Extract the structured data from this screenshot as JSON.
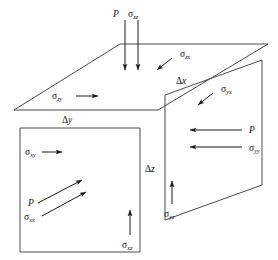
{
  "figure": {
    "background_color": "#ffffff",
    "line_color": "#4a4a4a",
    "arrow_color": "#1a1a1a",
    "text_color": "#111111"
  },
  "faces": {
    "top_face": {
      "name": "top-face",
      "normal_axis": "z",
      "points": "120,44 268,44 158,110 14,110"
    },
    "front_face": {
      "name": "front-face",
      "normal_axis": "x",
      "points": "20,128 140,128 140,252 20,252"
    },
    "right_face": {
      "name": "right-face",
      "normal_axis": "y",
      "points": "165,95 262,60 262,185 165,220"
    }
  },
  "labels": {
    "top_p": {
      "text": "P",
      "sub": ""
    },
    "sigma_zz": {
      "text": "σ",
      "sub": "zz"
    },
    "sigma_zx": {
      "text": "σ",
      "sub": "zx"
    },
    "sigma_zy": {
      "text": "σ",
      "sub": "zy"
    },
    "sigma_yx": {
      "text": "σ",
      "sub": "yx"
    },
    "right_p": {
      "text": "P",
      "sub": ""
    },
    "sigma_yy": {
      "text": "σ",
      "sub": "yy"
    },
    "sigma_yz": {
      "text": "σ",
      "sub": "yz"
    },
    "sigma_xy": {
      "text": "σ",
      "sub": "xy"
    },
    "front_p": {
      "text": "P",
      "sub": ""
    },
    "sigma_xx": {
      "text": "σ",
      "sub": "xx"
    },
    "sigma_xz": {
      "text": "σ",
      "sub": "xz"
    },
    "delta_x": {
      "text": "Δ",
      "sub": "x"
    },
    "delta_y": {
      "text": "Δ",
      "sub": "y"
    },
    "delta_z": {
      "text": "Δ",
      "sub": "z"
    }
  },
  "arrows": {
    "top_p_arrow": {
      "name": "top-p-arrow",
      "direction": "down",
      "d": "M 125,20 L 125,70"
    },
    "top_sigma_zz_arrow": {
      "name": "sigma-zz-arrow",
      "direction": "down",
      "d": "M 138,20 L 138,70"
    },
    "sigma_zx_arrow": {
      "name": "sigma-zx-arrow",
      "direction": "down-left",
      "d": "M 172,58 L 157,70"
    },
    "sigma_zy_arrow": {
      "name": "sigma-zy-arrow",
      "direction": "right",
      "d": "M 76,96 L 98,96"
    },
    "sigma_yx_arrow": {
      "name": "sigma-yx-arrow",
      "direction": "down-left",
      "d": "M 213,93 L 198,105"
    },
    "right_p_arrow": {
      "name": "right-p-arrow",
      "direction": "left",
      "d": "M 242,130 L 190,130"
    },
    "sigma_yy_arrow": {
      "name": "sigma-yy-arrow",
      "direction": "left",
      "d": "M 242,147 L 190,147"
    },
    "sigma_yz_arrow": {
      "name": "sigma-yz-arrow",
      "direction": "up",
      "d": "M 172,204 L 172,181"
    },
    "sigma_xy_arrow": {
      "name": "sigma-xy-arrow",
      "direction": "right",
      "d": "M 42,152 L 62,152"
    },
    "front_p_arrow": {
      "name": "front-p-arrow",
      "direction": "up-right",
      "d": "M 38,203 L 82,180"
    },
    "sigma_xx_arrow": {
      "name": "sigma-xx-arrow",
      "direction": "up-right",
      "d": "M 42,216 L 86,192"
    },
    "sigma_xz_arrow": {
      "name": "sigma-xz-arrow",
      "direction": "up",
      "d": "M 130,235 L 130,210"
    }
  }
}
